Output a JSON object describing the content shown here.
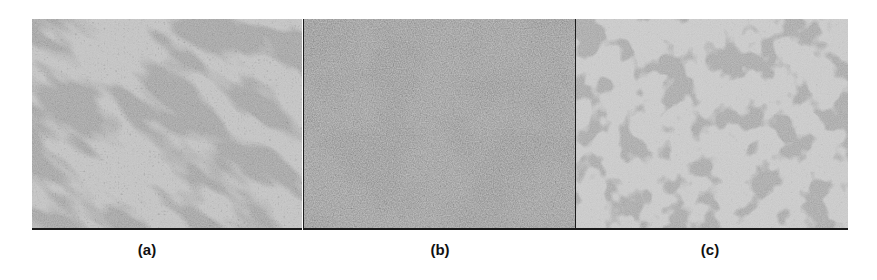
{
  "figure": {
    "panels": [
      {
        "id": "a",
        "label": "(a)",
        "description": "phase-contrast micrograph, dense diagonal bands of cell clusters"
      },
      {
        "id": "b",
        "label": "(b)",
        "description": "phase-contrast micrograph, near-confluent dense cell layer"
      },
      {
        "id": "c",
        "label": "(c)",
        "description": "phase-contrast micrograph, sparse scattered cell aggregates"
      }
    ]
  }
}
